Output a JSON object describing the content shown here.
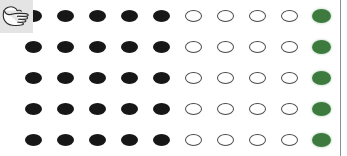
{
  "canvas": {
    "width": 347,
    "height": 156,
    "background": "#ffffff"
  },
  "cursor": {
    "icon": "pointing-hand-cursor",
    "badge_background": "#e4e4e4",
    "direction": "right"
  },
  "divider": {
    "name": "right-vertical-rule",
    "color": "#8d8f92",
    "x": 340
  },
  "legend": {
    "filled_dark_color": "#171717",
    "hollow_outline_color": "#4a4a4a",
    "hollow_fill_color": "#ffffff",
    "filled_green_color": "#3c7a3e"
  },
  "grid": {
    "rows": 5,
    "columns": 10,
    "row_y": [
      7,
      38,
      69,
      100,
      131
    ],
    "column_x": [
      25,
      57,
      89,
      121,
      153,
      185,
      217,
      249,
      281,
      312
    ],
    "cells": [
      [
        "filled-dark",
        "filled-dark",
        "filled-dark",
        "filled-dark",
        "filled-dark",
        "hollow",
        "hollow",
        "hollow",
        "hollow",
        "filled-green"
      ],
      [
        "filled-dark",
        "filled-dark",
        "filled-dark",
        "filled-dark",
        "filled-dark",
        "hollow",
        "hollow",
        "hollow",
        "hollow",
        "filled-green"
      ],
      [
        "filled-dark",
        "filled-dark",
        "filled-dark",
        "filled-dark",
        "filled-dark",
        "hollow",
        "hollow",
        "hollow",
        "hollow",
        "filled-green"
      ],
      [
        "filled-dark",
        "filled-dark",
        "filled-dark",
        "filled-dark",
        "filled-dark",
        "hollow",
        "hollow",
        "hollow",
        "hollow",
        "filled-green"
      ],
      [
        "filled-dark",
        "filled-dark",
        "filled-dark",
        "filled-dark",
        "filled-dark",
        "hollow",
        "hollow",
        "hollow",
        "hollow",
        "filled-green"
      ]
    ]
  }
}
